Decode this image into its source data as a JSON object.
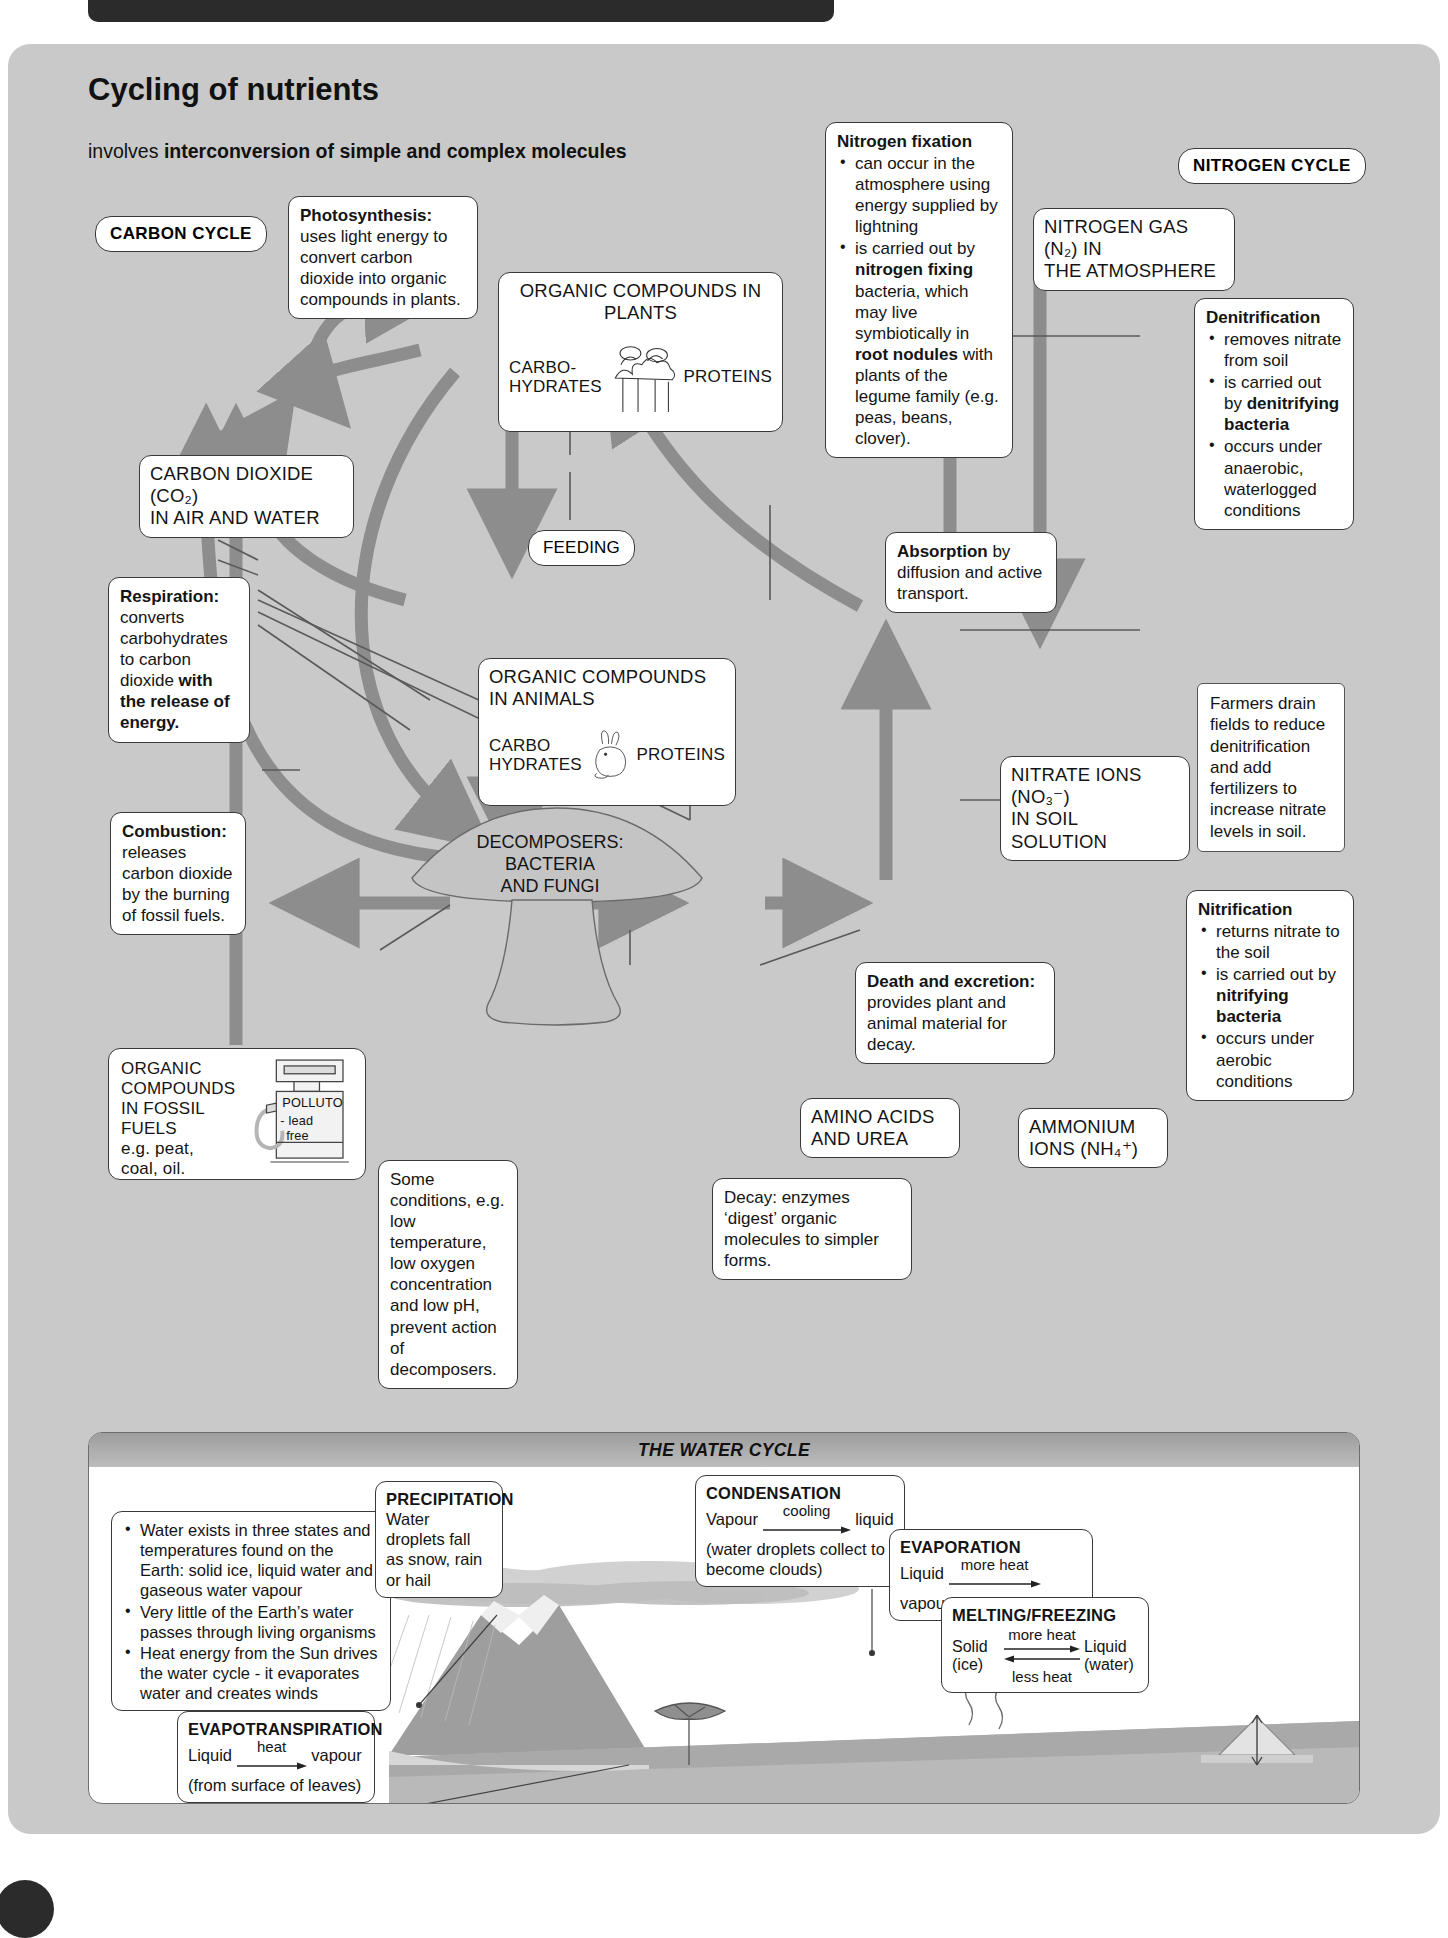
{
  "page": {
    "heading": "Cycling of nutrients",
    "subheading_plain": "involves ",
    "subheading_bold": "interconversion of simple and complex molecules"
  },
  "labels": {
    "carbon_cycle": "CARBON CYCLE",
    "nitrogen_cycle": "NITROGEN CYCLE",
    "feeding": "FEEDING"
  },
  "nodes": {
    "plants": {
      "title": "ORGANIC COMPOUNDS IN PLANTS",
      "left_label": "CARBO-<br>HYDRATES",
      "right_label": "PROTEINS"
    },
    "animals": {
      "title": "ORGANIC COMPOUNDS<br>IN ANIMALS",
      "left_label": "CARBO<br>HYDRATES",
      "right_label": "PROTEINS"
    },
    "co2": "CARBON DIOXIDE (CO₂)<br>IN AIR AND WATER",
    "n2": "NITROGEN GAS (N₂) IN<br>THE ATMOSPHERE",
    "nitrate": "NITRATE IONS (NO₃⁻)<br>IN SOIL SOLUTION",
    "ammonium": "AMMONIUM<br>IONS (NH₄⁺)",
    "amino": "AMINO ACIDS<br>AND UREA",
    "decomposers": "DECOMPOSERS:<br>BACTERIA<br>AND FUNGI",
    "fossil": "ORGANIC<br>COMPOUNDS<br>IN FOSSIL<br>FUELS<br>e.g. peat,<br>coal, oil.",
    "pump": {
      "brand": "POLLUTO",
      "line1": "- lead",
      "line2": "free"
    }
  },
  "notes": {
    "photosynthesis": {
      "head": "Photosynthesis:",
      "body": " uses light energy to convert carbon dioxide into organic compounds in plants."
    },
    "respiration": {
      "head": "Respiration:",
      "body_1": " converts carbohydrates to carbon dioxide ",
      "body_bold": "with the release of energy.",
      "body_2": ""
    },
    "combustion": {
      "head": "Combustion:",
      "body": " releases carbon dioxide by the burning of fossil fuels."
    },
    "nitrogen_fixation": {
      "head": "Nitrogen fixation",
      "bullets": [
        "can occur in the atmosphere using energy supplied by lightning",
        "is carried out by nitrogen fixing bacteria, which may live symbiotically in root nodules with plants of the legume family (e.g. peas, beans, clover)."
      ]
    },
    "absorption": {
      "head": "Absorption",
      "body": " by diffusion and active transport."
    },
    "denitrification": {
      "head": "Denitrification",
      "bullets": [
        "removes nitrate from soil",
        "is carried out by denitrifying bacteria",
        "occurs under anaerobic, waterlogged conditions"
      ]
    },
    "nitrification": {
      "head": "Nitrification",
      "bullets": [
        "returns nitrate to the soil",
        "is carried out by nitrifying bacteria",
        "occurs under aerobic conditions"
      ]
    },
    "farmers": "Farmers drain fields to reduce denitrification and add fertilizers to increase nitrate levels in soil.",
    "death": {
      "head": "Death and excretion:",
      "body": " provides plant and animal material for decay."
    },
    "decay": "Decay: enzymes ‘digest’ organic molecules to simpler forms.",
    "conditions": "Some conditions, e.g. low temperature, low oxygen concentration and low pH, prevent action of decomposers."
  },
  "water_cycle": {
    "banner": "THE WATER CYCLE",
    "facts": [
      "Water exists in three states and temperatures found on the Earth: solid ice, liquid water and gaseous water vapour",
      "Very little of the Earth’s water passes through living organisms",
      "Heat energy from the Sun drives the water cycle - it evaporates water and creates winds"
    ],
    "precipitation": {
      "head": "PRECIPITATION",
      "body": "Water droplets fall as snow, rain or hail"
    },
    "condensation": {
      "head": "CONDENSATION",
      "from": "Vapour",
      "over": "cooling",
      "to": "liquid",
      "body": "(water droplets collect to become clouds)"
    },
    "evaporation": {
      "head": "EVAPORATION",
      "from": "Liquid",
      "over": "more heat",
      "to": "vapour"
    },
    "melting": {
      "head": "MELTING/FREEZING",
      "left": "Solid (ice)",
      "right": "Liquid (water)",
      "over": "more heat",
      "under": "less heat"
    },
    "evapotranspiration": {
      "head": "EVAPOTRANSPIRATION",
      "from": "Liquid",
      "over": "heat",
      "to": "vapour",
      "body": "(from surface of leaves)"
    }
  },
  "colors": {
    "panel": "#c9c9c9",
    "arrow": "#8a8a8a",
    "thin_line": "#6b6b6b",
    "ink": "#141414"
  }
}
